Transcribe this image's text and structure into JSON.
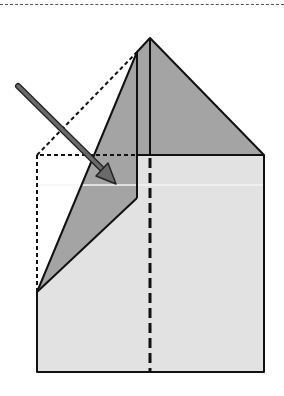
{
  "diagram": {
    "type": "origami-fold-step",
    "colors": {
      "paper_light": "#e2e2e2",
      "paper_dark": "#a4a4a4",
      "outline": "#111111",
      "arrow": "#6a6a6a",
      "top_rule": "#555555"
    },
    "elements": {
      "top_rule": "dashed separator line",
      "base_rectangle": "light paper body",
      "top_triangle": "dark triangular flap",
      "folded_flap": "dark folded left flap",
      "hidden_edges": "dashed outline of original square corner",
      "center_crease": "dashed vertical crease",
      "fold_arrow": "diagonal arrow indicating fold direction"
    }
  }
}
